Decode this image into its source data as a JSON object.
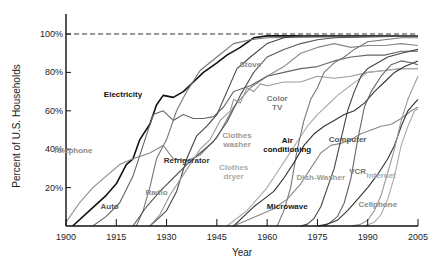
{
  "chart_data": {
    "type": "line",
    "title": "",
    "xlabel": "Year",
    "ylabel": "Percent of U.S. Households",
    "xlim": [
      1900,
      2005
    ],
    "ylim": [
      0,
      100
    ],
    "x_ticks": [
      1900,
      1915,
      1930,
      1945,
      1960,
      1975,
      1990,
      2005
    ],
    "x_tick_labels": [
      "1900",
      "1915",
      "1930",
      "1945",
      "1960",
      "1975",
      "1990",
      "2005"
    ],
    "y_ticks": [
      20,
      40,
      60,
      80,
      100
    ],
    "y_tick_labels": [
      "20%",
      "40%",
      "60%",
      "80%",
      "100%"
    ],
    "reference_line": {
      "value": 100,
      "style": "dashed"
    },
    "grid": false,
    "series": [
      {
        "name": "Electricity",
        "label": "Electricity",
        "color": "#111111",
        "label_color": "#111111",
        "points": [
          [
            1902,
            0
          ],
          [
            1907,
            8
          ],
          [
            1912,
            16
          ],
          [
            1915,
            22
          ],
          [
            1918,
            32
          ],
          [
            1920,
            35
          ],
          [
            1922,
            45
          ],
          [
            1925,
            53
          ],
          [
            1927,
            63
          ],
          [
            1929,
            68
          ],
          [
            1932,
            67
          ],
          [
            1935,
            70
          ],
          [
            1938,
            75
          ],
          [
            1941,
            80
          ],
          [
            1945,
            85
          ],
          [
            1948,
            89
          ],
          [
            1952,
            93
          ],
          [
            1956,
            98
          ],
          [
            1960,
            99
          ],
          [
            1970,
            99
          ],
          [
            2005,
            99
          ]
        ]
      },
      {
        "name": "Telephone",
        "label": "Telephone",
        "color": "#888888",
        "label_color": "#8a8a8a",
        "points": [
          [
            1900,
            2
          ],
          [
            1904,
            12
          ],
          [
            1908,
            20
          ],
          [
            1912,
            26
          ],
          [
            1916,
            32
          ],
          [
            1920,
            35
          ],
          [
            1925,
            38
          ],
          [
            1929,
            42
          ],
          [
            1932,
            35
          ],
          [
            1936,
            34
          ],
          [
            1940,
            37
          ],
          [
            1945,
            46
          ],
          [
            1950,
            62
          ],
          [
            1955,
            72
          ],
          [
            1960,
            78
          ],
          [
            1965,
            83
          ],
          [
            1970,
            90
          ],
          [
            1975,
            93
          ],
          [
            1980,
            95
          ],
          [
            1985,
            93
          ],
          [
            1990,
            94
          ],
          [
            1995,
            94
          ],
          [
            2000,
            95
          ],
          [
            2005,
            94
          ]
        ]
      },
      {
        "name": "Auto",
        "label": "Auto",
        "color": "#666666",
        "label_color": "#555555",
        "points": [
          [
            1908,
            0
          ],
          [
            1912,
            5
          ],
          [
            1916,
            12
          ],
          [
            1920,
            26
          ],
          [
            1923,
            42
          ],
          [
            1926,
            58
          ],
          [
            1929,
            60
          ],
          [
            1932,
            55
          ],
          [
            1935,
            58
          ],
          [
            1938,
            56
          ],
          [
            1941,
            56
          ],
          [
            1944,
            57
          ],
          [
            1947,
            62
          ],
          [
            1950,
            70
          ],
          [
            1955,
            73
          ],
          [
            1960,
            78
          ],
          [
            1965,
            80
          ],
          [
            1970,
            82
          ],
          [
            1975,
            83
          ],
          [
            1980,
            86
          ],
          [
            1985,
            88
          ],
          [
            1990,
            89
          ],
          [
            1995,
            89
          ],
          [
            2000,
            91
          ],
          [
            2005,
            91
          ]
        ]
      },
      {
        "name": "Radio",
        "label": "Radio",
        "color": "#777777",
        "label_color": "#8a8a8a",
        "points": [
          [
            1921,
            0
          ],
          [
            1923,
            8
          ],
          [
            1925,
            20
          ],
          [
            1927,
            35
          ],
          [
            1930,
            45
          ],
          [
            1933,
            60
          ],
          [
            1936,
            70
          ],
          [
            1940,
            81
          ],
          [
            1945,
            88
          ],
          [
            1950,
            95
          ],
          [
            1955,
            97
          ],
          [
            1960,
            98
          ],
          [
            2005,
            99
          ]
        ]
      },
      {
        "name": "Refrigerator",
        "label": "Refrigerator",
        "color": "#444444",
        "label_color": "#333333",
        "points": [
          [
            1925,
            0
          ],
          [
            1927,
            3
          ],
          [
            1930,
            8
          ],
          [
            1933,
            18
          ],
          [
            1936,
            35
          ],
          [
            1939,
            47
          ],
          [
            1942,
            52
          ],
          [
            1945,
            58
          ],
          [
            1948,
            70
          ],
          [
            1951,
            82
          ],
          [
            1955,
            88
          ],
          [
            1960,
            95
          ],
          [
            1965,
            98
          ],
          [
            1970,
            99
          ],
          [
            2005,
            99
          ]
        ]
      },
      {
        "name": "Stove",
        "label": "Stove",
        "color": "#555555",
        "label_color": "#8a8a8a",
        "points": [
          [
            1920,
            0
          ],
          [
            1924,
            10
          ],
          [
            1928,
            18
          ],
          [
            1932,
            25
          ],
          [
            1936,
            32
          ],
          [
            1940,
            38
          ],
          [
            1944,
            44
          ],
          [
            1948,
            54
          ],
          [
            1952,
            68
          ],
          [
            1956,
            80
          ],
          [
            1960,
            88
          ],
          [
            1965,
            92
          ],
          [
            1970,
            95
          ],
          [
            1975,
            97
          ],
          [
            1980,
            98
          ],
          [
            2005,
            99
          ]
        ]
      },
      {
        "name": "Clothes washer",
        "label": "Clothes washer",
        "color": "#999999",
        "label_color": "#999999",
        "points": [
          [
            1925,
            0
          ],
          [
            1928,
            6
          ],
          [
            1931,
            16
          ],
          [
            1934,
            24
          ],
          [
            1937,
            32
          ],
          [
            1940,
            40
          ],
          [
            1943,
            45
          ],
          [
            1946,
            55
          ],
          [
            1949,
            60
          ],
          [
            1950,
            66
          ],
          [
            1952,
            64
          ],
          [
            1954,
            72
          ],
          [
            1956,
            70
          ],
          [
            1958,
            74
          ],
          [
            1960,
            73
          ],
          [
            1965,
            75
          ],
          [
            1970,
            75
          ],
          [
            1975,
            78
          ],
          [
            1980,
            77
          ],
          [
            1985,
            78
          ],
          [
            1990,
            80
          ],
          [
            1995,
            81
          ],
          [
            2000,
            82
          ],
          [
            2005,
            82
          ]
        ]
      },
      {
        "name": "Clothes dryer",
        "label": "Clothes dryer",
        "color": "#aaaaaa",
        "label_color": "#aaaaaa",
        "points": [
          [
            1948,
            0
          ],
          [
            1951,
            4
          ],
          [
            1954,
            8
          ],
          [
            1957,
            14
          ],
          [
            1960,
            20
          ],
          [
            1963,
            28
          ],
          [
            1966,
            36
          ],
          [
            1969,
            44
          ],
          [
            1972,
            52
          ],
          [
            1975,
            58
          ],
          [
            1978,
            63
          ],
          [
            1981,
            68
          ],
          [
            1984,
            72
          ],
          [
            1987,
            76
          ],
          [
            1990,
            80
          ],
          [
            1995,
            81
          ],
          [
            2000,
            82
          ],
          [
            2005,
            82
          ]
        ]
      },
      {
        "name": "Color TV",
        "label": "Color TV",
        "color": "#777777",
        "label_color": "#777777",
        "points": [
          [
            1963,
            0
          ],
          [
            1965,
            8
          ],
          [
            1967,
            20
          ],
          [
            1969,
            40
          ],
          [
            1971,
            55
          ],
          [
            1973,
            66
          ],
          [
            1975,
            72
          ],
          [
            1977,
            80
          ],
          [
            1980,
            85
          ],
          [
            1983,
            88
          ],
          [
            1986,
            92
          ],
          [
            1990,
            96
          ],
          [
            1995,
            97
          ],
          [
            2000,
            98
          ],
          [
            2005,
            98
          ]
        ]
      },
      {
        "name": "Air conditioning",
        "label": "Air conditioning",
        "color": "#333333",
        "label_color": "#111111",
        "points": [
          [
            1950,
            0
          ],
          [
            1953,
            5
          ],
          [
            1956,
            10
          ],
          [
            1959,
            14
          ],
          [
            1962,
            18
          ],
          [
            1965,
            25
          ],
          [
            1968,
            33
          ],
          [
            1971,
            42
          ],
          [
            1974,
            48
          ],
          [
            1977,
            52
          ],
          [
            1980,
            55
          ],
          [
            1983,
            58
          ],
          [
            1986,
            60
          ],
          [
            1989,
            64
          ],
          [
            1992,
            70
          ],
          [
            1995,
            75
          ],
          [
            1998,
            80
          ],
          [
            2001,
            83
          ],
          [
            2005,
            86
          ]
        ]
      },
      {
        "name": "Dish-Washer",
        "label": "Dish-Washer",
        "color": "#888888",
        "label_color": "#999999",
        "points": [
          [
            1950,
            0
          ],
          [
            1954,
            3
          ],
          [
            1958,
            6
          ],
          [
            1962,
            9
          ],
          [
            1966,
            14
          ],
          [
            1970,
            22
          ],
          [
            1973,
            30
          ],
          [
            1976,
            38
          ],
          [
            1979,
            42
          ],
          [
            1982,
            43
          ],
          [
            1985,
            45
          ],
          [
            1988,
            48
          ],
          [
            1991,
            50
          ],
          [
            1994,
            52
          ],
          [
            1997,
            53
          ],
          [
            2000,
            56
          ],
          [
            2003,
            60
          ],
          [
            2005,
            62
          ]
        ]
      },
      {
        "name": "Microwave",
        "label": "Microwave",
        "color": "#444444",
        "label_color": "#222222",
        "points": [
          [
            1970,
            0
          ],
          [
            1972,
            1
          ],
          [
            1974,
            4
          ],
          [
            1976,
            10
          ],
          [
            1978,
            20
          ],
          [
            1980,
            30
          ],
          [
            1982,
            45
          ],
          [
            1984,
            60
          ],
          [
            1986,
            70
          ],
          [
            1988,
            78
          ],
          [
            1990,
            82
          ],
          [
            1993,
            85
          ],
          [
            1996,
            88
          ],
          [
            2000,
            90
          ],
          [
            2005,
            92
          ]
        ]
      },
      {
        "name": "VCR",
        "label": "VCR",
        "color": "#666666",
        "label_color": "#777777",
        "points": [
          [
            1977,
            0
          ],
          [
            1979,
            2
          ],
          [
            1981,
            5
          ],
          [
            1983,
            12
          ],
          [
            1985,
            25
          ],
          [
            1987,
            45
          ],
          [
            1989,
            62
          ],
          [
            1991,
            70
          ],
          [
            1994,
            78
          ],
          [
            1997,
            84
          ],
          [
            2000,
            86
          ],
          [
            2003,
            85
          ],
          [
            2005,
            84
          ]
        ]
      },
      {
        "name": "Computer",
        "label": "Computer",
        "color": "#333333",
        "label_color": "#555555",
        "points": [
          [
            1975,
            0
          ],
          [
            1978,
            1
          ],
          [
            1981,
            3
          ],
          [
            1984,
            8
          ],
          [
            1987,
            14
          ],
          [
            1990,
            20
          ],
          [
            1993,
            27
          ],
          [
            1996,
            35
          ],
          [
            1998,
            42
          ],
          [
            2000,
            52
          ],
          [
            2002,
            60
          ],
          [
            2004,
            64
          ],
          [
            2005,
            66
          ]
        ]
      },
      {
        "name": "Internet",
        "label": "Internet",
        "color": "#aaaaaa",
        "label_color": "#aaaaaa",
        "points": [
          [
            1989,
            0
          ],
          [
            1992,
            2
          ],
          [
            1994,
            6
          ],
          [
            1996,
            14
          ],
          [
            1998,
            26
          ],
          [
            2000,
            42
          ],
          [
            2002,
            52
          ],
          [
            2003,
            56
          ],
          [
            2004,
            60
          ],
          [
            2005,
            61
          ]
        ]
      },
      {
        "name": "Cellphone",
        "label": "Cellphone",
        "color": "#999999",
        "label_color": "#888888",
        "points": [
          [
            1985,
            0
          ],
          [
            1988,
            1
          ],
          [
            1990,
            3
          ],
          [
            1992,
            8
          ],
          [
            1994,
            16
          ],
          [
            1996,
            28
          ],
          [
            1998,
            40
          ],
          [
            2000,
            55
          ],
          [
            2002,
            66
          ],
          [
            2004,
            74
          ],
          [
            2005,
            78
          ]
        ]
      }
    ],
    "label_positions": {
      "Electricity": [
        1917,
        67
      ],
      "Telephone": [
        1902,
        38
      ],
      "Auto": [
        1913,
        9
      ],
      "Radio": [
        1927,
        16
      ],
      "Refrigerator": [
        1936,
        33
      ],
      "Stove": [
        1955,
        83
      ],
      "Clothes washer": [
        1951,
        46
      ],
      "Clothes dryer": [
        1950,
        29
      ],
      "Color TV": [
        1963,
        65
      ],
      "Air conditioning": [
        1966,
        43
      ],
      "Dish-Washer": [
        1976,
        24
      ],
      "Microwave": [
        1966,
        9
      ],
      "VCR": [
        1987,
        27
      ],
      "Computer": [
        1984,
        44
      ],
      "Internet": [
        1994,
        25
      ],
      "Cellphone": [
        1993,
        10
      ]
    }
  }
}
